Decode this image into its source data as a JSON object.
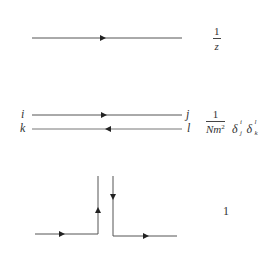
{
  "diagram": {
    "line_color": "#555555",
    "rows": [
      {
        "id": "single-propagator",
        "label": {
          "numerator": "1",
          "denominator": "z"
        }
      },
      {
        "id": "double-line-propagator",
        "endpoints": {
          "top_left": "i",
          "top_right": "j",
          "bottom_left": "k",
          "bottom_right": "l"
        },
        "label": {
          "numerator": "1",
          "denominator_base": "Nm",
          "denominator_exponent": "2",
          "delta_symbol": "δ",
          "delta1": {
            "sup": "i",
            "sub": "j"
          },
          "delta2": {
            "sup": "l",
            "sub": "k"
          }
        }
      },
      {
        "id": "vertex",
        "label": "1"
      }
    ]
  }
}
